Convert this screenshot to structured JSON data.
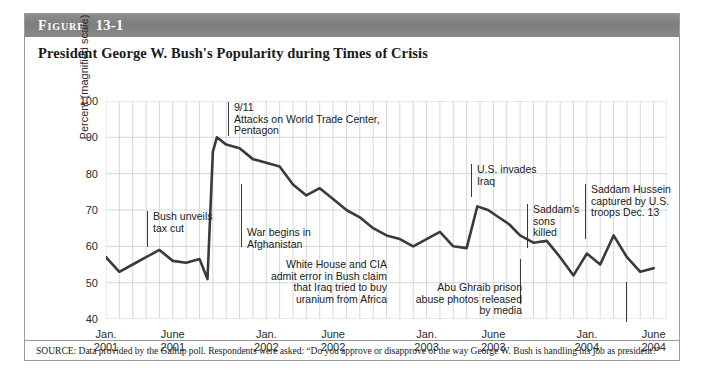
{
  "figure": {
    "label": "Figure",
    "number": "13-1",
    "title": "President George W. Bush's Popularity during Times of Crisis",
    "source": "SOURCE: Data provided by the Gallup poll. Respondents were asked: “Do you approve or disapprove of the way George W. Bush is handling his job as president?”"
  },
  "colors": {
    "line": "#3a3a3a",
    "grid": "#d3d8de",
    "bar_background": "#828282",
    "border": "#9a9a9a",
    "text": "#202020"
  },
  "chart_data": {
    "type": "line",
    "title": "President George W. Bush's Popularity during Times of Crisis",
    "xlabel": "",
    "ylabel": "Percent (magnified scale)",
    "ylim": [
      40,
      100
    ],
    "yticks": [
      40,
      50,
      60,
      70,
      80,
      90,
      100
    ],
    "xlim": [
      0,
      42
    ],
    "xticks": [
      {
        "pos": 0,
        "line1": "Jan.",
        "line2": "2001"
      },
      {
        "pos": 5,
        "line1": "June",
        "line2": "2001"
      },
      {
        "pos": 12,
        "line1": "Jan.",
        "line2": "2002"
      },
      {
        "pos": 17,
        "line1": "June",
        "line2": "2002"
      },
      {
        "pos": 24,
        "line1": "Jan.",
        "line2": "2003"
      },
      {
        "pos": 29,
        "line1": "June",
        "line2": "2003"
      },
      {
        "pos": 36,
        "line1": "Jan.",
        "line2": "2004"
      },
      {
        "pos": 41,
        "line1": "June",
        "line2": "2004"
      }
    ],
    "grid": true,
    "legend": "none",
    "series": [
      {
        "name": "Presidential approval rating",
        "x": [
          0,
          1,
          2,
          3,
          4,
          5,
          6,
          7,
          7.6,
          8.0,
          8.3,
          9,
          10,
          11,
          12,
          13,
          14,
          15,
          16,
          17,
          18,
          19,
          20,
          21,
          22,
          23,
          24,
          25,
          26,
          27,
          27.8,
          28.6,
          29.4,
          30.2,
          31,
          32,
          33,
          34,
          35,
          36,
          37,
          38,
          39,
          40,
          41
        ],
        "values": [
          57,
          53,
          55,
          57,
          59,
          56,
          55.5,
          56.5,
          51,
          86,
          90,
          88,
          87,
          84,
          83,
          82,
          77,
          74,
          76,
          73,
          70,
          68,
          65,
          63,
          62,
          60,
          62,
          64,
          60,
          59.5,
          71,
          70,
          68,
          66,
          63,
          61,
          61.5,
          57,
          52,
          58,
          55,
          63,
          57,
          53,
          54
        ],
        "color": "#3a3a3a",
        "linewidth": 2.6
      }
    ],
    "annotations": [
      {
        "id": "bush-tax-cut",
        "text": "Bush unveils\ntax cut",
        "align": "left",
        "x_label": 128,
        "y_label": 197,
        "rule_x": 122,
        "rule_top": 197,
        "rule_height": 36
      },
      {
        "id": "september-11",
        "text": "9/11\nAttacks on World Trade Center,\nPentagon",
        "align": "left",
        "x_label": 209,
        "y_label": 88,
        "rule_x": 203,
        "rule_top": 88,
        "rule_height": 34
      },
      {
        "id": "war-afghanistan",
        "text": "War begins in\nAfghanistan",
        "align": "left",
        "x_label": 222,
        "y_label": 213,
        "rule_x": 216,
        "rule_top": 170,
        "rule_height": 63
      },
      {
        "id": "white-house-cia-uranium",
        "text": "White House and CIA\nadmit error in Bush claim\nthat Iraq tried to buy\nuranium from Africa",
        "align": "right",
        "x_label": 362,
        "y_label": 245,
        "rule_x": 495,
        "rule_top": 245,
        "rule_height": 45
      },
      {
        "id": "us-invades-iraq",
        "text": "U.S. invades\nIraq",
        "align": "left",
        "x_label": 452,
        "y_label": 150,
        "rule_x": 446,
        "rule_top": 150,
        "rule_height": 33
      },
      {
        "id": "saddams-sons-killed",
        "text": "Saddam's\nsons\nkilled",
        "align": "left",
        "x_label": 508,
        "y_label": 190,
        "rule_x": 502,
        "rule_top": 190,
        "rule_height": 44
      },
      {
        "id": "saddam-captured",
        "text": "Saddam Hussein\ncaptured by U.S.\ntroops Dec. 13",
        "align": "left",
        "x_label": 566,
        "y_label": 170,
        "rule_x": 560,
        "rule_top": 170,
        "rule_height": 55
      },
      {
        "id": "abu-ghraib",
        "text": "Abu Ghraib prison\nabuse photos released\nby media",
        "align": "right",
        "x_label": 497,
        "y_label": 268,
        "rule_x": 601,
        "rule_top": 268,
        "rule_height": 40
      }
    ]
  }
}
